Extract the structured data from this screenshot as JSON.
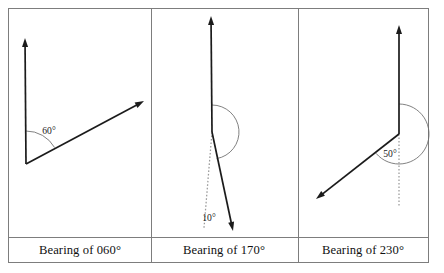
{
  "figure": {
    "panel_count": 3,
    "background_color": "#ffffff",
    "border_color": "#7d7d7d",
    "ray_color": "#1b1b1b",
    "arc_color": "#6a6a6a",
    "dotted_color": "#9a9a9a"
  },
  "table": {
    "left": 8,
    "top": 8,
    "right": 428,
    "bottom": 262,
    "divider_y": 237,
    "divider_x1": 151,
    "divider_x2": 298
  },
  "panels": [
    {
      "id": "panel-060",
      "caption": "Bearing of 060°",
      "caption_x": 80,
      "caption_y": 254,
      "angle_label": "60°",
      "angle_value": 60,
      "angle_label_x": 49,
      "angle_label_y": 134,
      "vertex_x": 26,
      "vertex_y": 164,
      "north_tip_x": 25,
      "north_tip_y": 38,
      "bearing_tip_x": 144,
      "bearing_tip_y": 101,
      "arc_radius": 33,
      "has_dotted_reference": false
    },
    {
      "id": "panel-170",
      "caption": "Bearing of 170°",
      "caption_x": 224,
      "caption_y": 254,
      "angle_label": "10°",
      "angle_value": 170,
      "angle_label_x": 209,
      "angle_label_y": 221,
      "vertex_x": 212,
      "vertex_y": 132,
      "north_tip_x": 211,
      "north_tip_y": 16,
      "bearing_tip_x": 233,
      "bearing_tip_y": 231,
      "arc_radius": 27,
      "has_dotted_reference": true,
      "dotted_end_x": 204,
      "dotted_end_y": 228
    },
    {
      "id": "panel-230",
      "caption": "Bearing of 230°",
      "caption_x": 363,
      "caption_y": 254,
      "angle_label": "50°",
      "angle_value": 230,
      "angle_label_x": 390,
      "angle_label_y": 157,
      "vertex_x": 399,
      "vertex_y": 134,
      "north_tip_x": 399,
      "north_tip_y": 25,
      "bearing_tip_x": 316,
      "bearing_tip_y": 199,
      "arc_radius": 30,
      "has_dotted_reference": true,
      "dotted_end_x": 399,
      "dotted_end_y": 207
    }
  ]
}
